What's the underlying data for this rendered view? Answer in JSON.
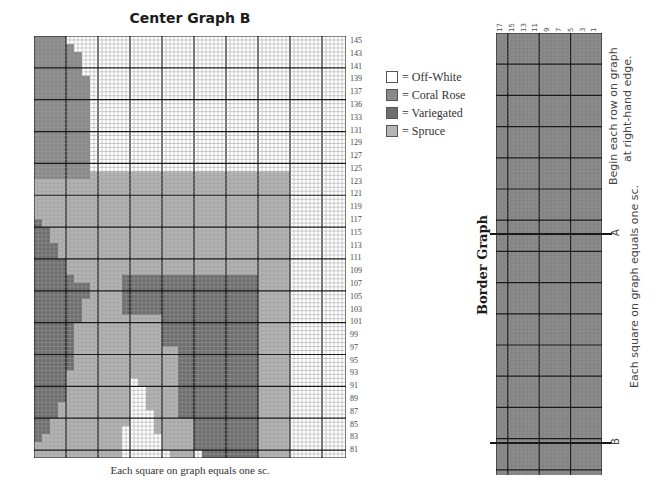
{
  "center_graph": {
    "title": "Center Graph B",
    "caption": "Each square on graph equals one sc.",
    "cols": 78,
    "rows": 106,
    "major_every": 8,
    "row_labels": [
      "145",
      "143",
      "141",
      "139",
      "137",
      "136",
      "133",
      "131",
      "129",
      "127",
      "125",
      "123",
      "121",
      "119",
      "117",
      "115",
      "113",
      "111",
      "109",
      "107",
      "105",
      "103",
      "101",
      "99",
      "97",
      "95",
      "93",
      "91",
      "89",
      "87",
      "85",
      "83",
      "81"
    ],
    "colors": {
      "off_white": "#ffffff",
      "coral_rose": "#8a8a8a",
      "variegated": "#6e6e6e",
      "spruce": "#b4b4b4",
      "grid_minor": "#9a9a9a",
      "grid_major": "#1a1a1a"
    },
    "regions": [
      {
        "name": "upper-left-coral-rose",
        "color": "coral_rose",
        "points": "0,0 8,0 8,2 10,2 10,4 12,4 12,10 14,10 14,36 0,36"
      },
      {
        "name": "left-spruce-band",
        "color": "spruce",
        "points": "0,36 14,36 14,34 64,34 64,106 0,106"
      },
      {
        "name": "left-variegated-arc",
        "color": "variegated",
        "points": "0,46 2,46 2,48 4,48 4,52 6,52 6,56 8,56 8,60 10,60 10,62 14,62 14,66 12,66 12,72 10,72 10,84 8,84 8,92 6,92 6,96 4,96 4,100 2,100 2,102 0,102"
      },
      {
        "name": "center-variegated-block",
        "color": "variegated",
        "points": "22,60 56,60 56,100 40,100 40,96 36,96 36,78 32,78 32,70 22,70"
      },
      {
        "name": "bottom-right-variegated",
        "color": "variegated",
        "points": "40,100 56,100 56,106 42,106 42,104 40,104"
      },
      {
        "name": "white-gap-right",
        "color": "off_white",
        "points": "64,34 78,34 78,106 64,106"
      },
      {
        "name": "bottom-white-triangle",
        "color": "off_white",
        "points": "24,86 26,86 26,88 28,88 28,94 30,94 30,100 32,100 32,104 34,104 34,106 22,106 22,98 24,98"
      },
      {
        "name": "white-small-bottom",
        "color": "off_white",
        "points": "40,104 42,104 42,106 40,106"
      }
    ]
  },
  "legend": {
    "items": [
      {
        "label": "= Off-White",
        "color": "#ffffff"
      },
      {
        "label": "= Coral Rose",
        "color": "#8a8a8a"
      },
      {
        "label": "= Variegated",
        "color": "#6e6e6e"
      },
      {
        "label": "= Spruce",
        "color": "#b4b4b4"
      }
    ]
  },
  "border_graph": {
    "title": "Border Graph",
    "col_labels": [
      "17",
      "15",
      "13",
      "11",
      "9",
      "7",
      "5",
      "3",
      "1"
    ],
    "fill": "#8c8c8c",
    "instruction_1": "Begin each row on graph",
    "instruction_2": "at right-hand edge.",
    "instruction_3": "Each square on graph equals one sc.",
    "markers": [
      {
        "label": "A",
        "y_offset": 200
      },
      {
        "label": "B",
        "y_offset": 409
      }
    ]
  }
}
